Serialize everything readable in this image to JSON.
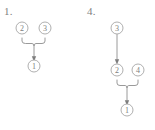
{
  "figure": {
    "background_color": "#ffffff",
    "ink_color": "#8f8f8f",
    "panels": [
      {
        "label": "1.",
        "nodes": [
          {
            "id": "p1-n2",
            "text": "2",
            "x": 22,
            "y": 28
          },
          {
            "id": "p1-n3",
            "text": "3",
            "x": 45,
            "y": 28
          },
          {
            "id": "p1-n1",
            "text": "1",
            "x": 34,
            "y": 66
          }
        ],
        "brace": {
          "left_x": 22,
          "right_x": 45,
          "top_y": 38,
          "bottom_y": 44,
          "center_x": 34
        },
        "edges": [
          {
            "from": "brace",
            "to": "p1-n1",
            "type": "arrow"
          }
        ]
      },
      {
        "label": "4.",
        "nodes": [
          {
            "id": "p4-n3",
            "text": "3",
            "x": 39,
            "y": 28
          },
          {
            "id": "p4-n2",
            "text": "2",
            "x": 39,
            "y": 70
          },
          {
            "id": "p4-n4",
            "text": "4",
            "x": 60,
            "y": 70
          },
          {
            "id": "p4-n1",
            "text": "1",
            "x": 49,
            "y": 110
          }
        ],
        "brace": {
          "left_x": 39,
          "right_x": 60,
          "top_y": 80,
          "bottom_y": 86,
          "center_x": 49
        },
        "edges": [
          {
            "from": "p4-n3",
            "to": "p4-n2",
            "type": "arrow"
          },
          {
            "from": "brace",
            "to": "p4-n1",
            "type": "arrow"
          }
        ]
      }
    ]
  }
}
